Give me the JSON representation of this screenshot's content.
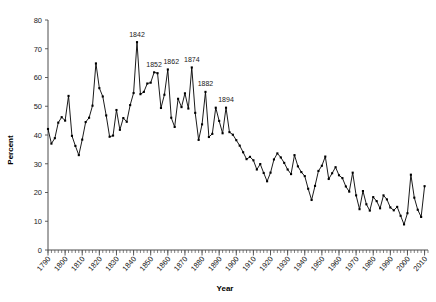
{
  "chart_data": {
    "type": "line",
    "title": "",
    "xlabel": "Year",
    "ylabel": "Percent",
    "xlim": [
      1790,
      2012
    ],
    "ylim": [
      0,
      80
    ],
    "ytick_step": 10,
    "xtick_step": 10,
    "minor_tick_step": 2,
    "grid": false,
    "legend": "none",
    "marker": "square",
    "line_color": "#000000",
    "axis_color": "#4d4d4d",
    "yticks": [
      0,
      10,
      20,
      30,
      40,
      50,
      60,
      70,
      80
    ],
    "xticks": [
      1790,
      1800,
      1810,
      1820,
      1830,
      1840,
      1850,
      1860,
      1870,
      1880,
      1890,
      1900,
      1910,
      1920,
      1930,
      1940,
      1950,
      1960,
      1970,
      1980,
      1990,
      2000,
      2010
    ],
    "annotations": [
      {
        "label": "1842",
        "x": 1842,
        "y": 72.3
      },
      {
        "label": "1852",
        "x": 1852,
        "y": 61.8
      },
      {
        "label": "1862",
        "x": 1862,
        "y": 62.8
      },
      {
        "label": "1874",
        "x": 1874,
        "y": 63.5
      },
      {
        "label": "1882",
        "x": 1882,
        "y": 55.0
      },
      {
        "label": "1894",
        "x": 1894,
        "y": 49.5
      }
    ],
    "x": [
      1790,
      1792,
      1794,
      1796,
      1798,
      1800,
      1802,
      1804,
      1806,
      1808,
      1810,
      1812,
      1814,
      1816,
      1818,
      1820,
      1822,
      1824,
      1826,
      1828,
      1830,
      1832,
      1834,
      1836,
      1838,
      1840,
      1842,
      1844,
      1846,
      1848,
      1850,
      1852,
      1854,
      1856,
      1858,
      1860,
      1862,
      1864,
      1866,
      1868,
      1870,
      1872,
      1874,
      1876,
      1878,
      1880,
      1882,
      1884,
      1886,
      1888,
      1890,
      1892,
      1894,
      1896,
      1898,
      1900,
      1902,
      1904,
      1906,
      1908,
      1910,
      1912,
      1914,
      1916,
      1918,
      1920,
      1922,
      1924,
      1926,
      1928,
      1930,
      1932,
      1934,
      1936,
      1938,
      1940,
      1942,
      1944,
      1946,
      1948,
      1950,
      1952,
      1954,
      1956,
      1958,
      1960,
      1962,
      1964,
      1966,
      1968,
      1970,
      1972,
      1974,
      1976,
      1978,
      1980,
      1982,
      1984,
      1986,
      1988,
      1990,
      1992,
      1994,
      1996,
      1998,
      2000,
      2002,
      2004,
      2006,
      2008,
      2010
    ],
    "y": [
      42.1,
      37.0,
      38.9,
      44.3,
      46.2,
      45.0,
      53.6,
      39.7,
      36.2,
      33.0,
      38.4,
      44.5,
      46.0,
      50.2,
      64.9,
      56.3,
      53.4,
      46.8,
      39.4,
      39.8,
      48.7,
      41.8,
      45.9,
      44.6,
      50.4,
      54.6,
      72.3,
      54.2,
      55.0,
      57.9,
      58.2,
      61.8,
      61.5,
      49.4,
      54.0,
      62.8,
      46.0,
      42.8,
      52.6,
      49.7,
      54.5,
      49.2,
      63.5,
      47.7,
      38.3,
      43.7,
      55.0,
      39.3,
      40.4,
      49.5,
      44.9,
      40.6,
      49.5,
      41.0,
      40.1,
      38.2,
      36.3,
      34.0,
      31.6,
      32.4,
      31.2,
      28.0,
      29.9,
      26.8,
      23.9,
      26.9,
      31.5,
      33.6,
      32.2,
      30.3,
      28.0,
      26.4,
      33.0,
      29.1,
      27.1,
      25.7,
      21.3,
      17.4,
      22.3,
      27.5,
      29.3,
      32.5,
      24.7,
      26.7,
      28.8,
      26.0,
      25.0,
      22.1,
      20.3,
      26.9,
      19.0,
      14.2,
      20.5,
      15.9,
      13.7,
      18.4,
      17.0,
      14.5,
      19.0,
      17.6,
      14.8,
      13.8,
      15.0,
      11.9,
      8.9,
      12.8,
      26.2,
      18.2,
      14.0,
      11.5,
      22.2
    ]
  }
}
